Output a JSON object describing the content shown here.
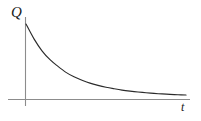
{
  "figure": {
    "title": "",
    "y_axis_label": "Q",
    "x_axis_label": "t",
    "colors": {
      "background": "#ffffff",
      "axis": "#8c8c8c",
      "curve": "#2b2b2b",
      "label": "#1a1a1a"
    }
  },
  "chart_data": {
    "type": "line",
    "title": "",
    "subtitle": "",
    "xlabel": "t",
    "ylabel": "Q",
    "grid": false,
    "legend": null,
    "annotations": [],
    "axis": {
      "x_tick_labels": [],
      "y_tick_labels": [],
      "xlim": [
        0,
        1
      ],
      "ylim": [
        0,
        1
      ],
      "origin_marked": true,
      "x_axis_extends_left_of_origin": true,
      "y_axis_extends_below_origin": true
    },
    "series": [
      {
        "name": "Q(t)",
        "form": "exponential-decay",
        "x": [
          0.0,
          0.05,
          0.1,
          0.15,
          0.2,
          0.25,
          0.3,
          0.35,
          0.4,
          0.45,
          0.5,
          0.55,
          0.6,
          0.65,
          0.7,
          0.75,
          0.8,
          0.85,
          0.9,
          0.95,
          1.0
        ],
        "y": [
          1.0,
          0.8,
          0.64,
          0.52,
          0.43,
          0.35,
          0.29,
          0.245,
          0.205,
          0.175,
          0.15,
          0.13,
          0.112,
          0.098,
          0.086,
          0.076,
          0.067,
          0.06,
          0.054,
          0.049,
          0.045
        ]
      }
    ]
  }
}
